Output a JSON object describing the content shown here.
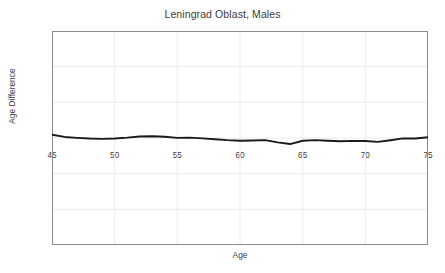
{
  "chart_data": {
    "type": "line",
    "title": "Leningrad Oblast, Males",
    "xlabel": "Age",
    "ylabel": "Age Difference",
    "xlim": [
      45,
      75
    ],
    "ylim": [
      -15,
      15
    ],
    "xticks": [
      45,
      50,
      55,
      60,
      65,
      70,
      75
    ],
    "yticks": [
      15,
      10,
      5,
      0,
      -5,
      -10,
      -15
    ],
    "xtick_labels": [
      "45",
      "50",
      "55",
      "60",
      "65",
      "70",
      "75"
    ],
    "ytick_labels": [
      "15",
      "10",
      "5",
      "0",
      "−5",
      "−10",
      "−15"
    ],
    "grid": true,
    "legend": "none",
    "series": [
      {
        "name": "Age Difference",
        "color": "#1a1a1a",
        "x": [
          45,
          46,
          47,
          48,
          49,
          50,
          51,
          52,
          53,
          54,
          55,
          56,
          57,
          58,
          59,
          60,
          61,
          62,
          63,
          64,
          65,
          66,
          67,
          68,
          69,
          70,
          71,
          72,
          73,
          74,
          75
        ],
        "values": [
          0.45,
          0.15,
          0.02,
          -0.08,
          -0.12,
          -0.08,
          0.05,
          0.22,
          0.25,
          0.18,
          0.02,
          0.05,
          -0.05,
          -0.18,
          -0.3,
          -0.38,
          -0.35,
          -0.3,
          -0.62,
          -0.85,
          -0.38,
          -0.3,
          -0.38,
          -0.45,
          -0.4,
          -0.42,
          -0.55,
          -0.32,
          -0.05,
          -0.08,
          0.1
        ]
      }
    ]
  },
  "colors": {
    "background": "#ffffff",
    "line": "#1a1a1a",
    "axis": "#8c8c8c",
    "grid": "#ececec",
    "text": "#3c3c3c"
  }
}
